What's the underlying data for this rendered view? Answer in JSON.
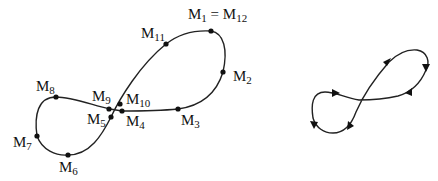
{
  "left_figure": {
    "description": "figure-eight curve with marked points",
    "points": [
      {
        "id": "M1",
        "label": "M",
        "sub": "1",
        "extra": " = M",
        "extra_sub": "12"
      },
      {
        "id": "M2",
        "label": "M",
        "sub": "2"
      },
      {
        "id": "M3",
        "label": "M",
        "sub": "3"
      },
      {
        "id": "M4",
        "label": "M",
        "sub": "4"
      },
      {
        "id": "M5",
        "label": "M",
        "sub": "5"
      },
      {
        "id": "M6",
        "label": "M",
        "sub": "6"
      },
      {
        "id": "M7",
        "label": "M",
        "sub": "7"
      },
      {
        "id": "M8",
        "label": "M",
        "sub": "8"
      },
      {
        "id": "M9",
        "label": "M",
        "sub": "9"
      },
      {
        "id": "M10",
        "label": "M",
        "sub": "10"
      },
      {
        "id": "M11",
        "label": "M",
        "sub": "11"
      }
    ]
  },
  "right_figure": {
    "description": "oriented figure-eight curve with direction arrows",
    "arrow_count": 6
  }
}
